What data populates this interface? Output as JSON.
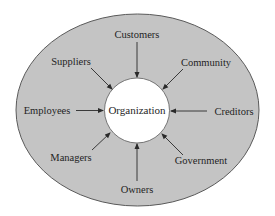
{
  "diagram": {
    "type": "stakeholder-diagram",
    "colors": {
      "background": "#ffffff",
      "ellipse_fill": "#c4c4c4",
      "ellipse_stroke": "#5a5a5a",
      "circle_fill": "#ffffff",
      "circle_stroke": "#5a5a5a",
      "arrow": "#2a2a2a",
      "text": "#1f1f1f"
    },
    "center": {
      "label": "Organization"
    },
    "stakeholders": [
      {
        "label": "Customers",
        "position": "top"
      },
      {
        "label": "Suppliers",
        "position": "top-left"
      },
      {
        "label": "Community",
        "position": "top-right"
      },
      {
        "label": "Employees",
        "position": "left"
      },
      {
        "label": "Creditors",
        "position": "right"
      },
      {
        "label": "Managers",
        "position": "bottom-left"
      },
      {
        "label": "Government",
        "position": "bottom-right"
      },
      {
        "label": "Owners",
        "position": "bottom"
      }
    ],
    "arrow_direction": "inward-to-center"
  }
}
